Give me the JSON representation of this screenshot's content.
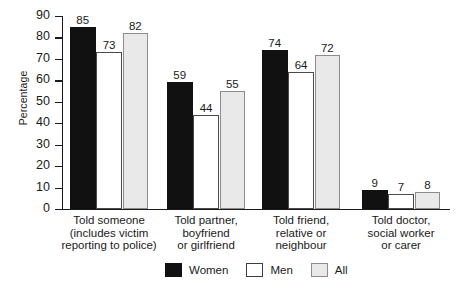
{
  "chart_data": {
    "type": "bar",
    "title": "",
    "xlabel": "",
    "ylabel": "Percentage",
    "ylim": [
      0,
      90
    ],
    "ytick_step": 10,
    "yticks": [
      90,
      80,
      70,
      60,
      50,
      40,
      30,
      20,
      10,
      0
    ],
    "grid": false,
    "legend_position": "bottom-center",
    "categories": [
      "Told someone\n(includes victim\nreporting to police)",
      "Told partner,\nboyfriend\nor girlfriend",
      "Told friend,\nrelative or\nneighbour",
      "Told doctor,\nsocial worker\nor carer"
    ],
    "category_lines": [
      [
        "Told someone",
        "(includes victim",
        "reporting to police)"
      ],
      [
        "Told partner,",
        "boyfriend",
        "or girlfriend"
      ],
      [
        "Told friend,",
        "relative or",
        "neighbour"
      ],
      [
        "Told doctor,",
        "social worker",
        "or carer"
      ]
    ],
    "series": [
      {
        "name": "Women",
        "color": "#111111",
        "values": [
          85,
          59,
          74,
          9
        ]
      },
      {
        "name": "Men",
        "color": "#ffffff",
        "values": [
          73,
          44,
          64,
          7
        ]
      },
      {
        "name": "All",
        "color": "#e9e9e9",
        "values": [
          82,
          55,
          72,
          8
        ]
      }
    ]
  },
  "legend": {
    "items": [
      {
        "label": "Women",
        "swatch": "women"
      },
      {
        "label": "Men",
        "swatch": "men"
      },
      {
        "label": "All",
        "swatch": "all"
      }
    ]
  },
  "colors": {
    "women": "#111111",
    "men": "#ffffff",
    "all": "#e9e9e9",
    "axis": "#1a1a1a",
    "background": "#ffffff"
  }
}
